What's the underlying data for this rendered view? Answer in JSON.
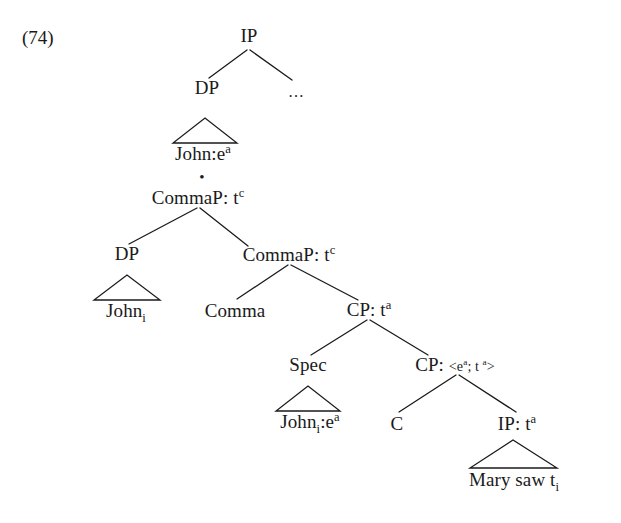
{
  "example": {
    "number": "(74)"
  },
  "separator": {
    "glyph": "•",
    "name": "bullet-separator"
  },
  "tree_upper": {
    "nodes": {
      "ip_root": {
        "label": "IP"
      },
      "dp": {
        "label": "DP"
      },
      "ellipsis": {
        "label": "…"
      },
      "john_leaf": {
        "text": "John:e",
        "superscript": "a"
      }
    }
  },
  "tree_lower": {
    "nodes": {
      "commap_top": {
        "text": "CommaP: t",
        "superscript": "c"
      },
      "dp_left": {
        "label": "DP"
      },
      "john_i_leaf": {
        "text": "John",
        "subscript": "i"
      },
      "commap_inner": {
        "text": "CommaP: t",
        "superscript": "c"
      },
      "comma_leaf": {
        "label": "Comma"
      },
      "cp_outer": {
        "text": "CP: t",
        "superscript": "a"
      },
      "spec": {
        "label": "Spec"
      },
      "john_i_ea_leaf": {
        "text": "John",
        "subscript": "i",
        "text2": ":e",
        "superscript": "a"
      },
      "cp_inner": {
        "text": "CP: ",
        "type_open": "<e",
        "type_sup1": "a",
        "type_sep": "; t ",
        "type_sup2": "a",
        "type_close": ">"
      },
      "c_leaf": {
        "label": "C"
      },
      "ip_lower": {
        "text": "IP: t",
        "superscript": "a"
      },
      "mary_leaf": {
        "text": "Mary saw t",
        "subscript": "i"
      }
    }
  },
  "style": {
    "line_color": "#1a1a1a",
    "text_color": "#1a1a1a",
    "background": "#ffffff"
  }
}
